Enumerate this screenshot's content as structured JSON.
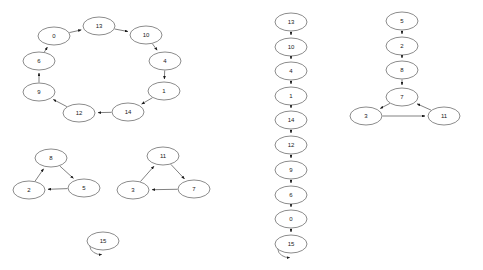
{
  "figure": {
    "title": "",
    "background_color": "#ffffff",
    "node_fill": "#ffffff",
    "node_stroke": "#5a5a5a",
    "edge_color": "#4a4a4a",
    "label_color": "#1a1a1a"
  },
  "graph_data": {
    "type": "diagram",
    "description": "Three directed-graph components drawn side by side: a left panel with a 9-node directed cycle, two 3-node directed triangles and a self-looping node; a middle panel showing the same vertices as one vertical directed chain ending in a self-loop; a right panel showing a vertical chain feeding a directed triangle.",
    "panels": [
      {
        "id": "left-panel",
        "name": "left-components",
        "components": [
          {
            "id": "left-cycle",
            "name": "nine-node-cycle",
            "nodes": [
              {
                "id": "0",
                "label": "0",
                "cx": 54,
                "cy": 36
              },
              {
                "id": "13",
                "label": "13",
                "cx": 99,
                "cy": 26
              },
              {
                "id": "10",
                "label": "10",
                "cx": 146,
                "cy": 35
              },
              {
                "id": "4",
                "label": "4",
                "cx": 165,
                "cy": 61
              },
              {
                "id": "1",
                "label": "1",
                "cx": 164,
                "cy": 91
              },
              {
                "id": "14",
                "label": "14",
                "cx": 128,
                "cy": 112
              },
              {
                "id": "12",
                "label": "12",
                "cx": 79,
                "cy": 113
              },
              {
                "id": "9",
                "label": "9",
                "cx": 39,
                "cy": 92
              },
              {
                "id": "6",
                "label": "6",
                "cx": 39,
                "cy": 61
              }
            ],
            "edges": [
              {
                "from": "0",
                "to": "13"
              },
              {
                "from": "13",
                "to": "10"
              },
              {
                "from": "10",
                "to": "4"
              },
              {
                "from": "4",
                "to": "1"
              },
              {
                "from": "1",
                "to": "14"
              },
              {
                "from": "14",
                "to": "12"
              },
              {
                "from": "12",
                "to": "9"
              },
              {
                "from": "9",
                "to": "6"
              },
              {
                "from": "6",
                "to": "0"
              }
            ]
          },
          {
            "id": "left-triangle-a",
            "name": "triangle-8-5-2",
            "nodes": [
              {
                "id": "8",
                "label": "8",
                "cx": 51,
                "cy": 158
              },
              {
                "id": "5",
                "label": "5",
                "cx": 84,
                "cy": 188
              },
              {
                "id": "2",
                "label": "2",
                "cx": 29,
                "cy": 190
              }
            ],
            "edges": [
              {
                "from": "8",
                "to": "5"
              },
              {
                "from": "5",
                "to": "2"
              },
              {
                "from": "2",
                "to": "8"
              }
            ]
          },
          {
            "id": "left-triangle-b",
            "name": "triangle-11-7-3",
            "nodes": [
              {
                "id": "11",
                "label": "11",
                "cx": 163,
                "cy": 156
              },
              {
                "id": "7",
                "label": "7",
                "cx": 194,
                "cy": 189
              },
              {
                "id": "3",
                "label": "3",
                "cx": 133,
                "cy": 190
              }
            ],
            "edges": [
              {
                "from": "11",
                "to": "7"
              },
              {
                "from": "7",
                "to": "3"
              },
              {
                "from": "3",
                "to": "11"
              }
            ]
          },
          {
            "id": "left-selfloop",
            "name": "self-loop-node-15",
            "nodes": [
              {
                "id": "15",
                "label": "15",
                "cx": 103,
                "cy": 241
              }
            ],
            "edges": [
              {
                "from": "15",
                "to": "15",
                "self": true
              }
            ]
          }
        ]
      },
      {
        "id": "middle-panel",
        "name": "middle-chain",
        "components": [
          {
            "id": "middle-chain",
            "name": "vertical-chain",
            "nodes": [
              {
                "id": "13",
                "label": "13",
                "cx": 291,
                "cy": 22
              },
              {
                "id": "10",
                "label": "10",
                "cx": 291,
                "cy": 47
              },
              {
                "id": "4",
                "label": "4",
                "cx": 291,
                "cy": 71
              },
              {
                "id": "1",
                "label": "1",
                "cx": 291,
                "cy": 96
              },
              {
                "id": "14",
                "label": "14",
                "cx": 291,
                "cy": 120
              },
              {
                "id": "12",
                "label": "12",
                "cx": 291,
                "cy": 145
              },
              {
                "id": "9",
                "label": "9",
                "cx": 291,
                "cy": 170
              },
              {
                "id": "6",
                "label": "6",
                "cx": 291,
                "cy": 195
              },
              {
                "id": "0",
                "label": "0",
                "cx": 291,
                "cy": 219
              },
              {
                "id": "15",
                "label": "15",
                "cx": 291,
                "cy": 244
              }
            ],
            "edges": [
              {
                "from": "13",
                "to": "10"
              },
              {
                "from": "10",
                "to": "4"
              },
              {
                "from": "4",
                "to": "1"
              },
              {
                "from": "1",
                "to": "14"
              },
              {
                "from": "14",
                "to": "12"
              },
              {
                "from": "12",
                "to": "9"
              },
              {
                "from": "9",
                "to": "6"
              },
              {
                "from": "6",
                "to": "0"
              },
              {
                "from": "0",
                "to": "15"
              },
              {
                "from": "15",
                "to": "15",
                "self": true
              }
            ]
          }
        ]
      },
      {
        "id": "right-panel",
        "name": "right-component",
        "components": [
          {
            "id": "right-chain-triangle",
            "name": "chain-into-triangle",
            "nodes": [
              {
                "id": "5",
                "label": "5",
                "cx": 402,
                "cy": 21
              },
              {
                "id": "2",
                "label": "2",
                "cx": 402,
                "cy": 46
              },
              {
                "id": "8",
                "label": "8",
                "cx": 402,
                "cy": 70
              },
              {
                "id": "7",
                "label": "7",
                "cx": 402,
                "cy": 97
              },
              {
                "id": "3",
                "label": "3",
                "cx": 366,
                "cy": 116
              },
              {
                "id": "11",
                "label": "11",
                "cx": 444,
                "cy": 116
              }
            ],
            "edges": [
              {
                "from": "5",
                "to": "2"
              },
              {
                "from": "2",
                "to": "8"
              },
              {
                "from": "8",
                "to": "7"
              },
              {
                "from": "7",
                "to": "3"
              },
              {
                "from": "3",
                "to": "11"
              },
              {
                "from": "11",
                "to": "7"
              }
            ]
          }
        ]
      }
    ],
    "node_geometry": {
      "rx": 16,
      "ry": 9
    },
    "all_node_labels": [
      "0",
      "1",
      "2",
      "3",
      "4",
      "5",
      "6",
      "7",
      "8",
      "9",
      "10",
      "11",
      "12",
      "13",
      "14",
      "15"
    ]
  }
}
